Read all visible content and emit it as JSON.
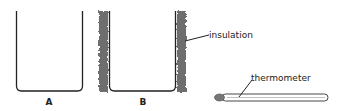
{
  "beakers": [
    {
      "id": "A",
      "label": "A",
      "insulated": false
    },
    {
      "id": "B",
      "label": "B",
      "insulated": true
    }
  ],
  "annotations": {
    "insulation": "insulation",
    "thermometer": "thermometer"
  },
  "colors": {
    "outline": "#222222",
    "insulation": "#6e6e6e"
  }
}
